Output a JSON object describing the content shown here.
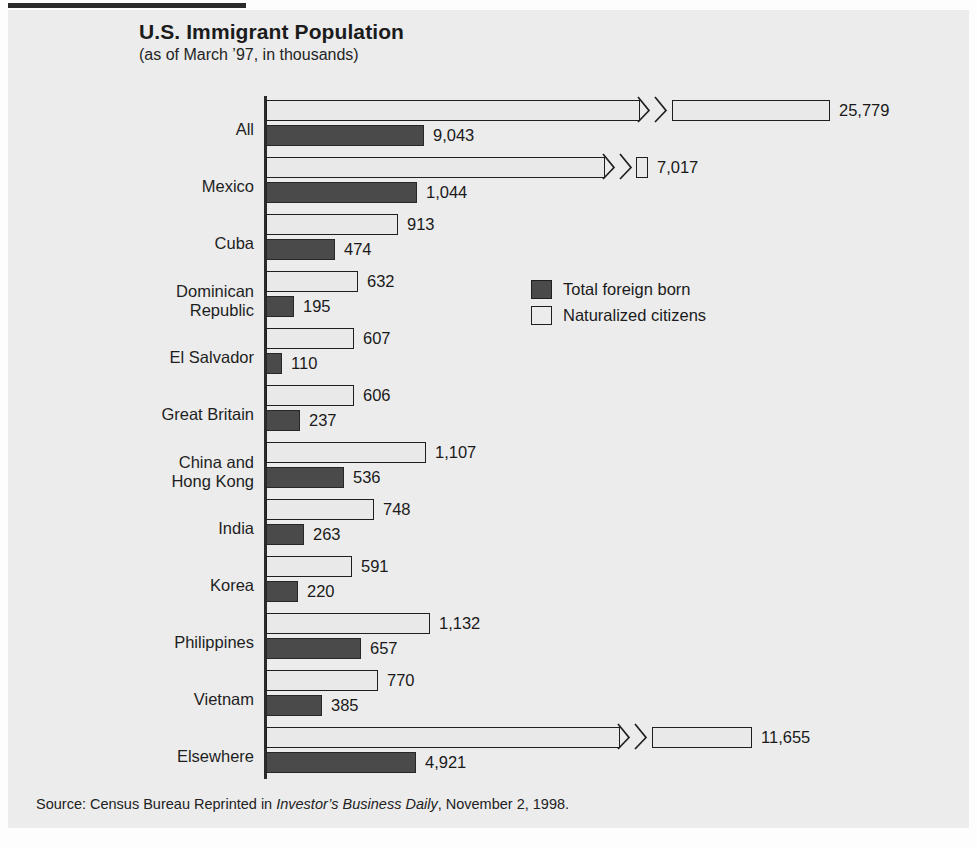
{
  "header": {
    "title": "U.S. Immigrant Population",
    "subtitle": "(as of March ’97, in thousands)"
  },
  "legend": {
    "items": [
      {
        "label": "Total foreign born",
        "swatch": "dark",
        "color": "#4a4a4a"
      },
      {
        "label": "Naturalized citizens",
        "swatch": "light",
        "color": "#ececec"
      }
    ]
  },
  "source": {
    "prefix": "Source: Census Bureau Reprinted in ",
    "italic": "Investor’s Business Daily",
    "suffix": ", November 2, 1998."
  },
  "chart_data": {
    "type": "bar",
    "orientation": "horizontal",
    "title": "U.S. Immigrant Population",
    "subtitle": "(as of March '97, in thousands)",
    "xlabel": "",
    "ylabel": "",
    "units": "thousands",
    "grid": false,
    "legend_position": "middle-right",
    "axis_break": true,
    "xlim": [
      0,
      1200
    ],
    "categories": [
      "All",
      "Mexico",
      "Cuba",
      "Dominican\nRepublic",
      "El Salvador",
      "Great Britain",
      "China and\nHong Kong",
      "India",
      "Korea",
      "Philippines",
      "Vietnam",
      "Elsewhere"
    ],
    "series": [
      {
        "name": "Naturalized citizens",
        "color": "#ececec",
        "values": [
          25779,
          7017,
          913,
          632,
          607,
          606,
          1107,
          748,
          591,
          1132,
          770,
          11655
        ],
        "labels": [
          "25,779",
          "7,017",
          "913",
          "632",
          "607",
          "606",
          "1,107",
          "748",
          "591",
          "1,132",
          "770",
          "11,655"
        ]
      },
      {
        "name": "Total foreign born",
        "color": "#4a4a4a",
        "values": [
          9043,
          1044,
          474,
          195,
          110,
          237,
          536,
          263,
          220,
          657,
          385,
          4921
        ],
        "labels": [
          "9,043",
          "1,044",
          "474",
          "195",
          "110",
          "237",
          "536",
          "263",
          "220",
          "657",
          "385",
          "4,921"
        ]
      }
    ]
  },
  "layout": {
    "axis_x": 266,
    "plot_top": 100,
    "row_height": 57,
    "bar_height": 21,
    "px_per_unit": 0.1449,
    "broken_rows": [
      {
        "index": 0,
        "series": 0,
        "break_at": 640,
        "resume_at": 672,
        "end": 830
      },
      {
        "index": 1,
        "series": 0,
        "break_at": 605,
        "resume_at": 636,
        "end": 648
      },
      {
        "index": 11,
        "series": 0,
        "break_at": 620,
        "resume_at": 652,
        "end": 752
      }
    ],
    "broken_dark_rows": [
      {
        "index": 0,
        "series": 1,
        "end": 424
      },
      {
        "index": 11,
        "series": 1,
        "end": 416
      }
    ]
  }
}
